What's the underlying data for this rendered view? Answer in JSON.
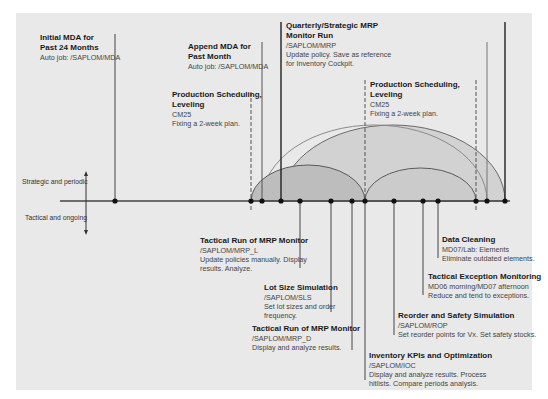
{
  "axis": {
    "upper_label": "Strategic and periodic",
    "lower_label": "Tactical and ongoing"
  },
  "colors": {
    "panel_bg": "#e9e9e9",
    "line": "#3a3a3a",
    "arc_fill_dark": "#b9b9b9",
    "arc_fill_light": "#cfcfcf",
    "dot": "#111111"
  },
  "top_events": [
    {
      "title_1": "Initial MDA for",
      "title_2": "Past 24 Months",
      "code": "Auto job: /SAPLOM/MDA",
      "desc_1": "",
      "desc_2": ""
    },
    {
      "title_1": "Append MDA for",
      "title_2": "Past Month",
      "code": "Auto job: /SAPLOM/MDA",
      "desc_1": "",
      "desc_2": ""
    },
    {
      "title_1": "Production Scheduling,",
      "title_2": "Leveling",
      "code": "CM25",
      "desc_1": "Fixing a 2-week plan.",
      "desc_2": ""
    },
    {
      "title_1": "Quarterly/Strategic MRP",
      "title_2": "Monitor Run",
      "code": "/SAPLOM/MRP",
      "desc_1": "Update policy. Save as reference",
      "desc_2": "for Inventory Cockpit."
    },
    {
      "title_1": "Production Scheduling,",
      "title_2": "Leveling",
      "code": "CM25",
      "desc_1": "Fixing a 2-week plan.",
      "desc_2": ""
    }
  ],
  "bottom_events": [
    {
      "title": "Tactical Run of MRP Monitor",
      "code": "/SAPLOM/MRP_L",
      "desc_1": "Update policies manually. Display",
      "desc_2": "results. Analyze."
    },
    {
      "title": "Lot Size Simulation",
      "code": "/SAPLOM/SLS",
      "desc_1": "Set lot sizes and order",
      "desc_2": "frequency."
    },
    {
      "title": "Tactical Run of MRP Monitor",
      "code": "/SAPLOM/MRP_D",
      "desc_1": "Display and analyze results.",
      "desc_2": ""
    },
    {
      "title": "Inventory KPIs and Optimization",
      "code": "/SAPLOM/IOC",
      "desc_1": "Display and analyze results. Process",
      "desc_2": "hitlists. Compare periods analysis."
    },
    {
      "title": "Reorder and Safety Simulation",
      "code": "/SAPLOM/ROP",
      "desc_1": "Set reorder points for Vx. Set safety stocks.",
      "desc_2": ""
    },
    {
      "title": "Tactical Exception Monitoring",
      "code": "MD06 morning/MD07 afternoon",
      "desc_1": "Reduce and tend to exceptions.",
      "desc_2": ""
    },
    {
      "title": "Data Cleaning",
      "code": "MD07/Lab: Elements",
      "desc_1": "Eliminate outdated elements.",
      "desc_2": ""
    }
  ]
}
